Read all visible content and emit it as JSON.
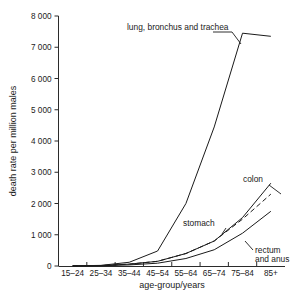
{
  "chart_data": {
    "type": "line",
    "title": "",
    "xlabel": "age-group/years",
    "ylabel": "death rate per million males",
    "categories": [
      "15–24",
      "25–34",
      "35–44",
      "45–54",
      "55–64",
      "65–74",
      "75–84",
      "85+"
    ],
    "ylim": [
      0,
      8000
    ],
    "ytick_labels": [
      "0",
      "1 000",
      "2 000",
      "3 000",
      "4 000",
      "5 000",
      "6 000",
      "7 000",
      "8 000"
    ],
    "ytick_values": [
      0,
      1000,
      2000,
      3000,
      4000,
      5000,
      6000,
      7000,
      8000
    ],
    "grid": false,
    "legend_position": "inline-annotations",
    "series": [
      {
        "name": "lung, bronchus and trachea",
        "label": "lung, bronchus and trachea",
        "style": "solid",
        "values": [
          5,
          20,
          120,
          480,
          2000,
          4450,
          7450,
          7350
        ]
      },
      {
        "name": "colon",
        "label": "colon",
        "style": "solid",
        "values": [
          5,
          15,
          60,
          150,
          400,
          800,
          1550,
          2650
        ]
      },
      {
        "name": "stomach",
        "label": "stomach",
        "style": "dashed",
        "values": [
          5,
          15,
          60,
          150,
          400,
          800,
          1500,
          2300
        ]
      },
      {
        "name": "rectum and anus",
        "label": "rectum\nand anus",
        "label_line1": "rectum",
        "label_line2": "and anus",
        "style": "solid",
        "values": [
          2,
          8,
          35,
          90,
          240,
          520,
          1050,
          1750
        ]
      }
    ]
  },
  "annotations": {
    "lung": "lung, bronchus and trachea",
    "colon": "colon",
    "stomach": "stomach",
    "rectum_line1": "rectum",
    "rectum_line2": "and anus"
  },
  "axes": {
    "x_title": "age-group/years",
    "y_title": "death rate per million males"
  },
  "colors": {
    "ink": "#1a1a1a",
    "background": "#ffffff"
  }
}
